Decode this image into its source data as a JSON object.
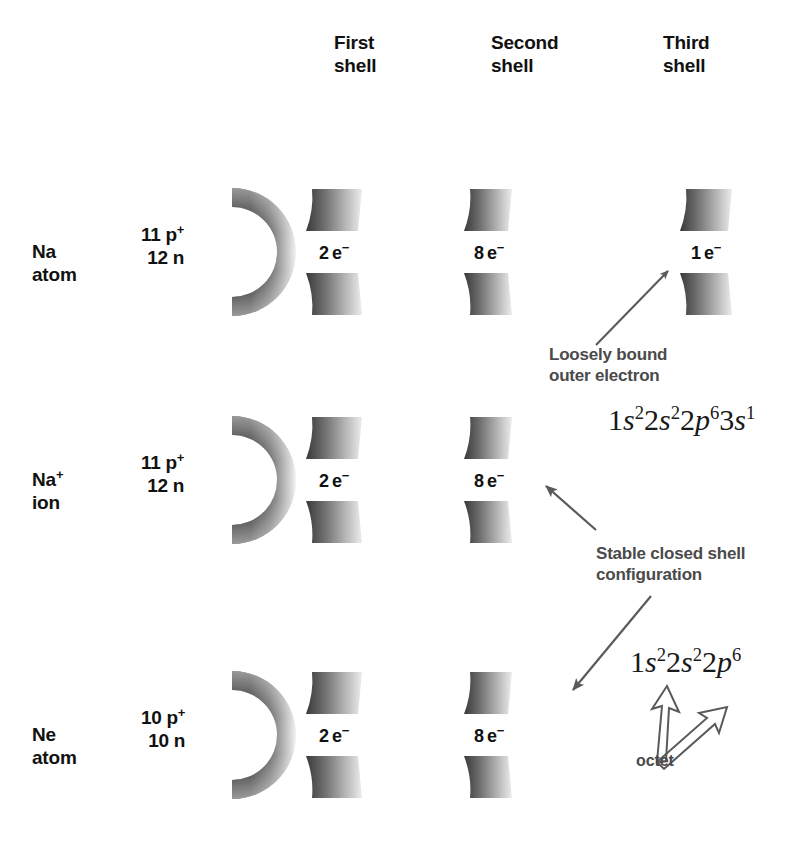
{
  "figure": {
    "background_color": "#ffffff",
    "ink_color": "#111111",
    "annotation_color": "#4a4a4a"
  },
  "columns": [
    {
      "id": "first",
      "label": "First\nshell"
    },
    {
      "id": "second",
      "label": "Second\nshell"
    },
    {
      "id": "third",
      "label": "Third\nshell"
    }
  ],
  "rows": [
    {
      "id": "na-atom",
      "species_label": "Na",
      "species_sup": "",
      "state_label": "atom",
      "nucleus_protons": "11 p",
      "nucleus_protons_sup": "+",
      "nucleus_neutrons": "12 n",
      "shells": [
        {
          "column": "first",
          "count": "2",
          "unit": "e",
          "charge": "−"
        },
        {
          "column": "second",
          "count": "8",
          "unit": "e",
          "charge": "−"
        },
        {
          "column": "third",
          "count": "1",
          "unit": "e",
          "charge": "−"
        }
      ]
    },
    {
      "id": "na-ion",
      "species_label": "Na",
      "species_sup": "+",
      "state_label": "ion",
      "nucleus_protons": "11 p",
      "nucleus_protons_sup": "+",
      "nucleus_neutrons": "12 n",
      "shells": [
        {
          "column": "first",
          "count": "2",
          "unit": "e",
          "charge": "−"
        },
        {
          "column": "second",
          "count": "8",
          "unit": "e",
          "charge": "−"
        }
      ]
    },
    {
      "id": "ne-atom",
      "species_label": "Ne",
      "species_sup": "",
      "state_label": "atom",
      "nucleus_protons": "10 p",
      "nucleus_protons_sup": "+",
      "nucleus_neutrons": "10 n",
      "shells": [
        {
          "column": "first",
          "count": "2",
          "unit": "e",
          "charge": "−"
        },
        {
          "column": "second",
          "count": "8",
          "unit": "e",
          "charge": "−"
        }
      ]
    }
  ],
  "annotations": {
    "loose_electron": "Loosely bound\nouter electron",
    "stable_shell": "Stable closed shell\nconfiguration",
    "octet": "octet"
  },
  "configurations": {
    "na_atom": {
      "plain": "1s2 2s2 2p6 3s1",
      "terms": [
        {
          "n": "1",
          "orbital": "s",
          "electrons": "2"
        },
        {
          "n": "2",
          "orbital": "s",
          "electrons": "2"
        },
        {
          "n": "2",
          "orbital": "p",
          "electrons": "6"
        },
        {
          "n": "3",
          "orbital": "s",
          "electrons": "1"
        }
      ]
    },
    "ne_like": {
      "plain": "1s2 2s2 2p6",
      "terms": [
        {
          "n": "1",
          "orbital": "s",
          "electrons": "2"
        },
        {
          "n": "2",
          "orbital": "s",
          "electrons": "2"
        },
        {
          "n": "2",
          "orbital": "p",
          "electrons": "6"
        }
      ]
    }
  }
}
